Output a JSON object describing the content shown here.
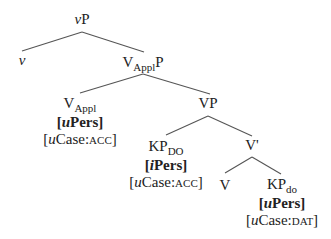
{
  "tree": {
    "nodes": {
      "vP": {
        "head": "v",
        "tail": "P"
      },
      "v": {
        "label": "v"
      },
      "VApplP": {
        "base": "V",
        "sub": "Appl",
        "tail": "P"
      },
      "VAppl": {
        "base": "V",
        "sub": "Appl",
        "feature1": {
          "open": "[",
          "prefix": "u",
          "name": "Pers",
          "close": "]"
        },
        "feature2": {
          "open": "[",
          "prefix": "u",
          "name": "Case:",
          "value": "acc",
          "close": "]"
        }
      },
      "VP": {
        "label": "VP"
      },
      "KPDO": {
        "base": "KP",
        "sub": "DO",
        "feature1": {
          "open": "[",
          "prefix": "i",
          "name": "Pers",
          "close": "]"
        },
        "feature2": {
          "open": "[",
          "prefix": "u",
          "name": "Case:",
          "value": "acc",
          "close": "]"
        }
      },
      "Vbar": {
        "label": "V'"
      },
      "V": {
        "label": "V"
      },
      "KPdo": {
        "base": "KP",
        "sub": "do",
        "feature1": {
          "open": "[",
          "prefix": "u",
          "name": "Pers",
          "close": "]"
        },
        "feature2": {
          "open": "[",
          "prefix": "u",
          "name": "Case:",
          "value": "dat",
          "close": "]"
        }
      }
    },
    "edges": [
      [
        "vP",
        "v"
      ],
      [
        "vP",
        "VApplP"
      ],
      [
        "VApplP",
        "VAppl"
      ],
      [
        "VApplP",
        "VP"
      ],
      [
        "VP",
        "KPDO"
      ],
      [
        "VP",
        "Vbar"
      ],
      [
        "Vbar",
        "V"
      ],
      [
        "Vbar",
        "KPdo"
      ]
    ]
  }
}
